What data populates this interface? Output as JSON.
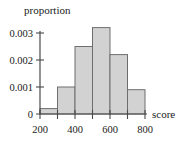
{
  "chart_data": {
    "type": "bar",
    "title": "",
    "subtitle": "",
    "xlabel": "score",
    "ylabel": "proportion",
    "categories": [
      "200-300",
      "300-400",
      "400-500",
      "500-600",
      "600-700",
      "700-800"
    ],
    "bin_edges": [
      200,
      300,
      400,
      500,
      600,
      700,
      800
    ],
    "values": [
      0.0002,
      0.001,
      0.0025,
      0.0032,
      0.0022,
      0.0009
    ],
    "xlim": [
      200,
      800
    ],
    "ylim": [
      0,
      0.0035
    ],
    "x_tick_labels": [
      "200",
      "400",
      "600",
      "800"
    ],
    "x_tick_values": [
      200,
      400,
      600,
      800
    ],
    "x_minor_tick_values": [
      300,
      500,
      700
    ],
    "y_tick_labels": [
      "0",
      "0.001",
      "0.002",
      "0.003"
    ],
    "y_tick_values": [
      0,
      0.001,
      0.002,
      0.003
    ],
    "grid": false,
    "legend": false,
    "legend_position": "none",
    "bar_fill_color": "#d2d2d2",
    "bar_edge_color": "#6e6e6e",
    "axis_color": "#4a4a4a"
  },
  "labels": {
    "y_axis_title": "proportion",
    "x_axis_title": "score",
    "y_tick_0": "0",
    "y_tick_1": "0.001",
    "y_tick_2": "0.002",
    "y_tick_3": "0.003",
    "x_tick_200": "200",
    "x_tick_400": "400",
    "x_tick_600": "600",
    "x_tick_800": "800"
  }
}
